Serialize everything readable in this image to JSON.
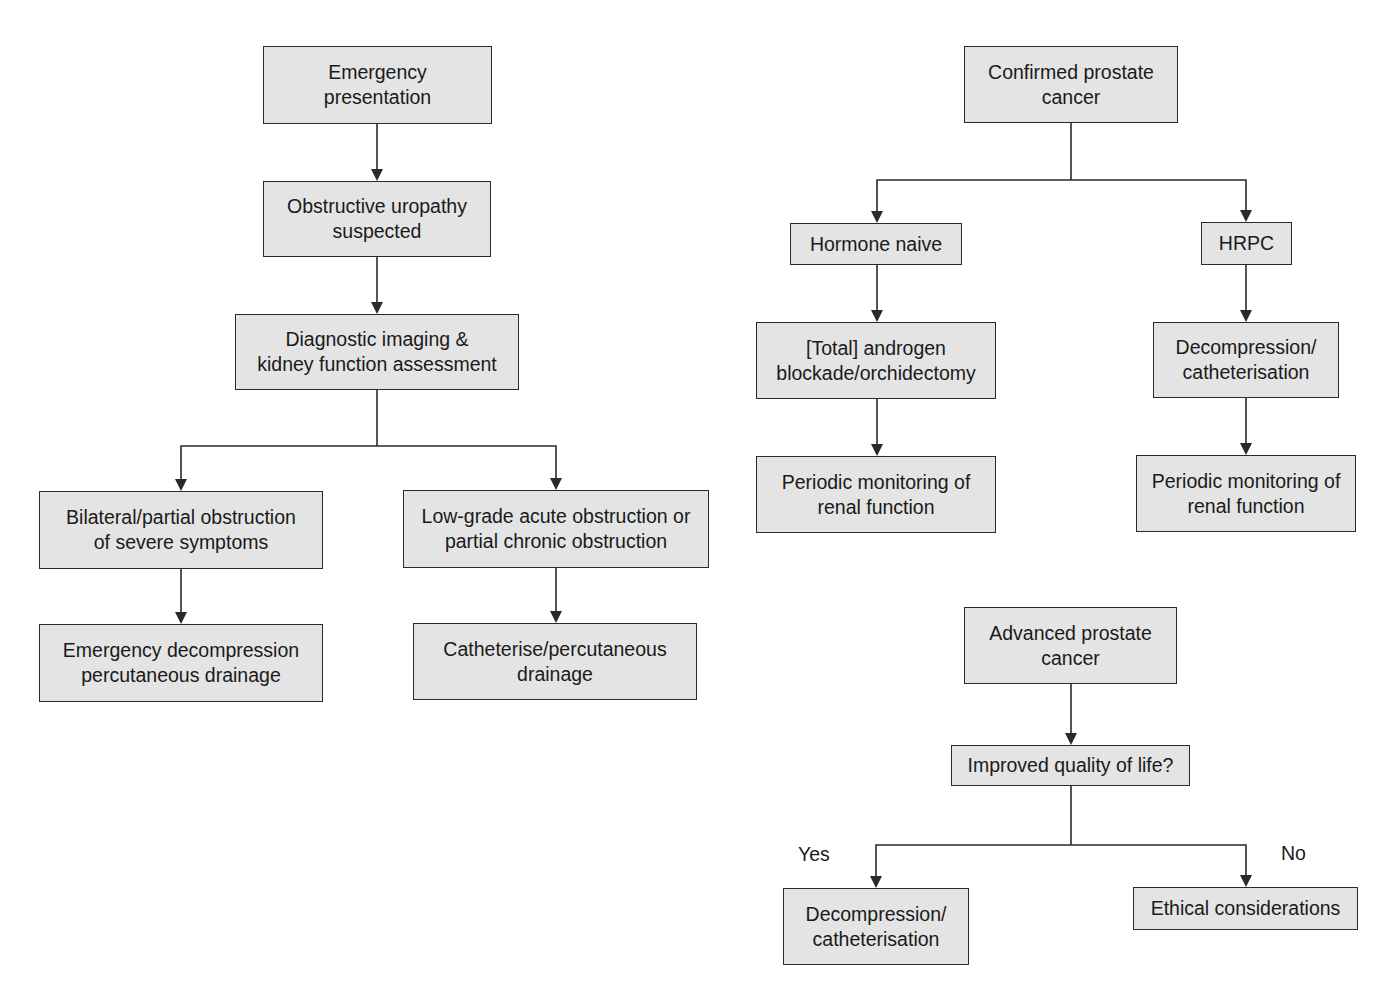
{
  "diagrams": [
    {
      "name": "emergency-obstructive-uropathy",
      "nodes": [
        {
          "id": "emergency-presentation",
          "text": "Emergency\npresentation",
          "x": 263,
          "y": 46,
          "w": 229,
          "h": 78
        },
        {
          "id": "obstructive-uropathy",
          "text": "Obstructive uropathy\nsuspected",
          "x": 263,
          "y": 181,
          "w": 228,
          "h": 76
        },
        {
          "id": "diagnostic-imaging",
          "text": "Diagnostic imaging &\nkidney function assessment",
          "x": 235,
          "y": 314,
          "w": 284,
          "h": 76
        },
        {
          "id": "bilateral-obstruction",
          "text": "Bilateral/partial obstruction\nof severe symptoms",
          "x": 39,
          "y": 491,
          "w": 284,
          "h": 78
        },
        {
          "id": "low-grade-obstruction",
          "text": "Low-grade acute obstruction or\npartial chronic obstruction",
          "x": 403,
          "y": 490,
          "w": 306,
          "h": 78
        },
        {
          "id": "emergency-decompression",
          "text": "Emergency decompression\npercutaneous drainage",
          "x": 39,
          "y": 624,
          "w": 284,
          "h": 78
        },
        {
          "id": "catheterise-drainage",
          "text": "Catheterise/percutaneous\ndrainage",
          "x": 413,
          "y": 623,
          "w": 284,
          "h": 77
        }
      ]
    },
    {
      "name": "confirmed-prostate-cancer",
      "nodes": [
        {
          "id": "confirmed-prostate-cancer",
          "text": "Confirmed prostate\ncancer",
          "x": 964,
          "y": 46,
          "w": 214,
          "h": 77
        },
        {
          "id": "hormone-naive",
          "text": "Hormone naive",
          "x": 790,
          "y": 223,
          "w": 172,
          "h": 42
        },
        {
          "id": "hrpc",
          "text": "HRPC",
          "x": 1201,
          "y": 222,
          "w": 91,
          "h": 43
        },
        {
          "id": "androgen-blockade",
          "text": "[Total] androgen\nblockade/orchidectomy",
          "x": 756,
          "y": 322,
          "w": 240,
          "h": 77
        },
        {
          "id": "decompression-hrpc",
          "text": "Decompression/\ncatheterisation",
          "x": 1153,
          "y": 322,
          "w": 186,
          "h": 76
        },
        {
          "id": "periodic-monitoring-left",
          "text": "Periodic monitoring of\nrenal function",
          "x": 756,
          "y": 456,
          "w": 240,
          "h": 77
        },
        {
          "id": "periodic-monitoring-right",
          "text": "Periodic monitoring of\nrenal function",
          "x": 1136,
          "y": 455,
          "w": 220,
          "h": 77
        }
      ]
    },
    {
      "name": "advanced-prostate-cancer",
      "nodes": [
        {
          "id": "advanced-prostate-cancer",
          "text": "Advanced prostate\ncancer",
          "x": 964,
          "y": 607,
          "w": 213,
          "h": 77
        },
        {
          "id": "improved-quality-of-life",
          "text": "Improved quality of life?",
          "x": 951,
          "y": 745,
          "w": 239,
          "h": 41
        },
        {
          "id": "decompression-yes",
          "text": "Decompression/\ncatheterisation",
          "x": 783,
          "y": 888,
          "w": 186,
          "h": 77
        },
        {
          "id": "ethical-considerations",
          "text": "Ethical considerations",
          "x": 1133,
          "y": 887,
          "w": 225,
          "h": 43
        }
      ],
      "labels": [
        {
          "id": "yes-label",
          "text": "Yes",
          "x": 798,
          "y": 843
        },
        {
          "id": "no-label",
          "text": "No",
          "x": 1281,
          "y": 842
        }
      ]
    }
  ],
  "connectors": [
    {
      "from": "emergency-presentation",
      "points": [
        [
          377,
          124
        ],
        [
          377,
          181
        ]
      ],
      "arrow": true
    },
    {
      "from": "obstructive-uropathy",
      "points": [
        [
          377,
          257
        ],
        [
          377,
          314
        ]
      ],
      "arrow": true
    },
    {
      "from": "diagnostic-imaging",
      "points": [
        [
          377,
          390
        ],
        [
          377,
          446
        ]
      ],
      "arrow": false
    },
    {
      "from": "branch-left",
      "points": [
        [
          377,
          446
        ],
        [
          181,
          446
        ],
        [
          181,
          491
        ]
      ],
      "arrow": true
    },
    {
      "from": "branch-right",
      "points": [
        [
          377,
          446
        ],
        [
          556,
          446
        ],
        [
          556,
          490
        ]
      ],
      "arrow": true
    },
    {
      "from": "bilateral-obstruction",
      "points": [
        [
          181,
          569
        ],
        [
          181,
          624
        ]
      ],
      "arrow": true
    },
    {
      "from": "low-grade-obstruction",
      "points": [
        [
          556,
          568
        ],
        [
          556,
          623
        ]
      ],
      "arrow": true
    },
    {
      "from": "confirmed-prostate-cancer",
      "points": [
        [
          1071,
          123
        ],
        [
          1071,
          180
        ]
      ],
      "arrow": false
    },
    {
      "from": "branch-hormone",
      "points": [
        [
          1071,
          180
        ],
        [
          877,
          180
        ],
        [
          877,
          223
        ]
      ],
      "arrow": true
    },
    {
      "from": "branch-hrpc",
      "points": [
        [
          1071,
          180
        ],
        [
          1246,
          180
        ],
        [
          1246,
          222
        ]
      ],
      "arrow": true
    },
    {
      "from": "hormone-naive",
      "points": [
        [
          877,
          265
        ],
        [
          877,
          322
        ]
      ],
      "arrow": true
    },
    {
      "from": "hrpc",
      "points": [
        [
          1246,
          265
        ],
        [
          1246,
          322
        ]
      ],
      "arrow": true
    },
    {
      "from": "androgen-blockade",
      "points": [
        [
          877,
          399
        ],
        [
          877,
          456
        ]
      ],
      "arrow": true
    },
    {
      "from": "decompression-hrpc",
      "points": [
        [
          1246,
          398
        ],
        [
          1246,
          455
        ]
      ],
      "arrow": true
    },
    {
      "from": "advanced-prostate-cancer",
      "points": [
        [
          1071,
          684
        ],
        [
          1071,
          745
        ]
      ],
      "arrow": true
    },
    {
      "from": "improved-quality-of-life",
      "points": [
        [
          1071,
          786
        ],
        [
          1071,
          845
        ]
      ],
      "arrow": false
    },
    {
      "from": "branch-yes",
      "points": [
        [
          1071,
          845
        ],
        [
          876,
          845
        ],
        [
          876,
          888
        ]
      ],
      "arrow": true
    },
    {
      "from": "branch-no",
      "points": [
        [
          1071,
          845
        ],
        [
          1246,
          845
        ],
        [
          1246,
          887
        ]
      ],
      "arrow": true
    }
  ],
  "colors": {
    "box_fill": "#e4e4e4",
    "box_border": "#2a2a2a",
    "line": "#2a2a2a",
    "background": "#ffffff"
  }
}
